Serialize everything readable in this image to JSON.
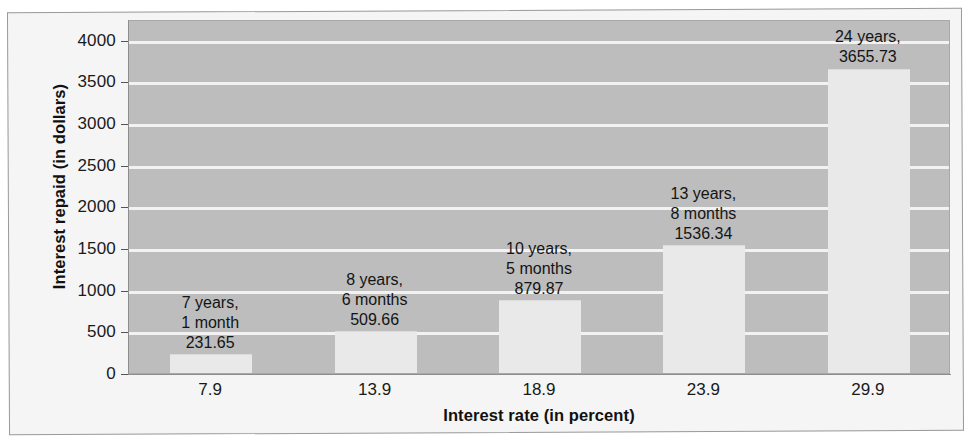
{
  "chart_data": {
    "type": "bar",
    "title": "",
    "xlabel": "Interest rate (in percent)",
    "ylabel": "Interest repaid (in dollars)",
    "categories": [
      "7.9",
      "13.9",
      "18.9",
      "23.9",
      "29.9"
    ],
    "values": [
      231.65,
      509.66,
      879.87,
      1536.34,
      3655.73
    ],
    "ylim": [
      0,
      4250
    ],
    "yticks": [
      "0",
      "500",
      "1000",
      "1500",
      "2000",
      "2500",
      "3000",
      "3500",
      "4000"
    ],
    "ytick_values": [
      0,
      500,
      1000,
      1500,
      2000,
      2500,
      3000,
      3500,
      4000
    ],
    "grid": true,
    "legend": "none",
    "point_labels": [
      {
        "line1": "7 years,",
        "line2": "1 month",
        "line3": "231.65"
      },
      {
        "line1": "8 years,",
        "line2": "6 months",
        "line3": "509.66"
      },
      {
        "line1": "10 years,",
        "line2": "5 months",
        "line3": "879.87"
      },
      {
        "line1": "13 years,",
        "line2": "8 months",
        "line3": "1536.34"
      },
      {
        "line1": "24 years,",
        "line2": "",
        "line3": "3655.73"
      }
    ],
    "colors": {
      "plot_background": "#bdbdbd",
      "bar_fill": "#e9e9e9",
      "gridline": "#f2f2f2",
      "text": "#141414",
      "page_background": "#f5f5f5"
    }
  }
}
